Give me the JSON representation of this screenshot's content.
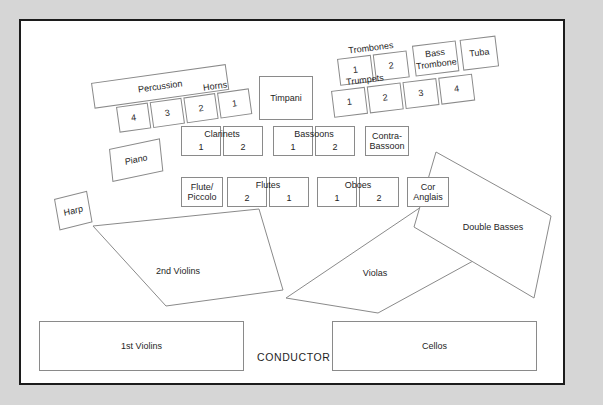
{
  "diagram": {
    "conductor_label": "CONDUCTOR",
    "colors": {
      "page_background": "#d6d6d6",
      "stage_background": "#ffffff",
      "frame_border": "#1c1c1c",
      "seat_border": "#8a8a8a",
      "text": "#1e1e1e"
    }
  },
  "percussion": {
    "label": "Percussion"
  },
  "horns": {
    "label": "Horns",
    "desks": [
      "4",
      "3",
      "2",
      "1"
    ]
  },
  "timpani": {
    "label": "Timpani"
  },
  "trombones": {
    "label": "Trombones",
    "desks": [
      "1",
      "2"
    ],
    "bass_trombone": "Bass\nTrombone",
    "bass_trombone_line1": "Bass",
    "bass_trombone_line2": "Trombone",
    "tuba": "Tuba"
  },
  "trumpets": {
    "label": "Trumpets",
    "desks": [
      "1",
      "2",
      "3",
      "4"
    ]
  },
  "woodwind_back_row": {
    "clarinets_label": "Clarinets",
    "clarinets": [
      "1",
      "2"
    ],
    "bassoons_label": "Bassoons",
    "bassoons": [
      "1",
      "2"
    ],
    "contra_bassoon_line1": "Contra-",
    "contra_bassoon_line2": "Bassoon"
  },
  "woodwind_front_row": {
    "flute_piccolo_line1": "Flute/",
    "flute_piccolo_line2": "Piccolo",
    "flutes_label": "Flutes",
    "flutes": [
      "2",
      "1"
    ],
    "oboes_label": "Oboes",
    "oboes": [
      "1",
      "2"
    ],
    "cor_anglais_line1": "Cor",
    "cor_anglais_line2": "Anglais"
  },
  "keyboard_harp": {
    "piano": "Piano",
    "harp": "Harp"
  },
  "strings": {
    "second_violins": "2nd Violins",
    "first_violins": "1st Violins",
    "violas": "Violas",
    "cellos": "Cellos",
    "double_basses": "Double Basses"
  }
}
